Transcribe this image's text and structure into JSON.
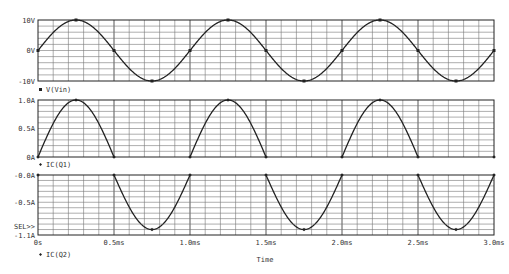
{
  "chart_data": [
    {
      "type": "line",
      "title": "",
      "legend": [
        {
          "marker": "square",
          "label": "V(Vin)"
        }
      ],
      "xlabel": "Time",
      "ylabel": "",
      "xlim": [
        0,
        3.0
      ],
      "ylim": [
        -10,
        10
      ],
      "yticks": [
        "10V",
        "0V",
        "-10V"
      ],
      "x_unit": "ms",
      "series": [
        {
          "name": "V(Vin)",
          "function": "10*sin(2*pi*t/1ms)",
          "amplitude": 10,
          "period_ms": 1.0,
          "x": [
            0,
            0.25,
            0.5,
            0.75,
            1.0,
            1.25,
            1.5,
            1.75,
            2.0,
            2.25,
            2.5,
            2.75,
            3.0
          ],
          "values": [
            0,
            10,
            0,
            -10,
            0,
            10,
            0,
            -10,
            0,
            10,
            0,
            -10,
            0
          ]
        }
      ]
    },
    {
      "type": "line",
      "legend": [
        {
          "marker": "diamond",
          "label": "IC(Q1)"
        }
      ],
      "xlim": [
        0,
        3.0
      ],
      "ylim": [
        0,
        1.0
      ],
      "yticks": [
        "1.0A",
        "0.5A",
        "0A"
      ],
      "series": [
        {
          "name": "IC(Q1)",
          "function": "max(0, 1.0*sin(2*pi*t/1ms))",
          "amplitude": 1.0,
          "period_ms": 1.0,
          "x": [
            0,
            0.25,
            0.5,
            0.75,
            1.0,
            1.25,
            1.5,
            1.75,
            2.0,
            2.25,
            2.5,
            2.75,
            3.0
          ],
          "values": [
            0,
            1.0,
            0,
            0,
            0,
            1.0,
            0,
            0,
            0,
            1.0,
            0,
            0,
            0
          ]
        }
      ]
    },
    {
      "type": "line",
      "legend": [
        {
          "marker": "diamond",
          "label": "IC(Q2)"
        }
      ],
      "xlim": [
        0,
        3.0
      ],
      "ylim": [
        -1.1,
        0
      ],
      "yticks": [
        "-0.0A",
        "-0.5A",
        "-1.1A"
      ],
      "annotation": "SEL>>",
      "series": [
        {
          "name": "IC(Q2)",
          "function": "min(0, 1.0*sin(2*pi*t/1ms))",
          "amplitude": -1.0,
          "period_ms": 1.0,
          "x": [
            0,
            0.25,
            0.5,
            0.75,
            1.0,
            1.25,
            1.5,
            1.75,
            2.0,
            2.25,
            2.5,
            2.75,
            3.0
          ],
          "values": [
            0,
            0,
            0,
            -1.0,
            0,
            0,
            0,
            -1.0,
            0,
            0,
            0,
            -1.0,
            0
          ]
        }
      ]
    }
  ],
  "xaxis": {
    "ticks": [
      "0s",
      "0.5ms",
      "1.0ms",
      "1.5ms",
      "2.0ms",
      "2.5ms",
      "3.0ms"
    ],
    "label": "Time"
  },
  "plots": [
    {
      "ylabels": [
        "10V",
        "0V",
        "-10V"
      ],
      "legend": "V(Vin)"
    },
    {
      "ylabels": [
        "1.0A",
        "0.5A",
        "0A"
      ],
      "legend": "IC(Q1)"
    },
    {
      "ylabels": [
        "-0.0A",
        "-0.5A",
        "-1.1A"
      ],
      "legend": "IC(Q2)",
      "sel": "SEL>>"
    }
  ]
}
